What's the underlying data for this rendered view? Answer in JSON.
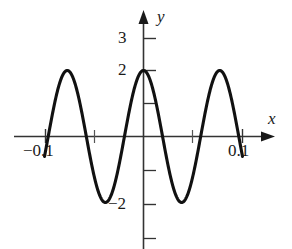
{
  "figure": {
    "type": "math-function-graph",
    "background_color": "#ffffff",
    "stroke_color": "#1a1a1a"
  },
  "axes": {
    "x_axis_label": "x",
    "y_axis_label": "y",
    "x_axis_name": "x-axis",
    "y_axis_name": "y-axis"
  },
  "tick_labels": {
    "y_3": "3",
    "y_2": "2",
    "y_neg2": "−2",
    "x_neg": "−0.1",
    "x_pos": "0.1"
  },
  "chart_data": {
    "type": "line",
    "title": "",
    "xlabel": "x",
    "ylabel": "y",
    "xlim": [
      -0.115,
      0.118
    ],
    "ylim": [
      -3.4,
      3.4
    ],
    "grid": false,
    "legend": null,
    "axis_style": "arrowed-cartesian",
    "x_ticks": [
      -0.1,
      -0.05,
      0.05,
      0.1
    ],
    "x_tick_labels": [
      "−0.1",
      "",
      "",
      "0.1"
    ],
    "y_ticks": [
      -3,
      -2,
      -1,
      1,
      2,
      3
    ],
    "y_tick_labels": [
      "",
      "−2",
      "",
      "",
      "2",
      "3"
    ],
    "series": [
      {
        "name": "y = 2 cos(81.6 x)",
        "amplitude": 2,
        "period": 0.077,
        "x_domain": [
          -0.1,
          0.1
        ],
        "x": [
          -0.1,
          -0.0904,
          -0.0808,
          -0.0712,
          -0.0616,
          -0.052,
          -0.0424,
          -0.0328,
          -0.0232,
          -0.0136,
          -0.004,
          0.004,
          0.0136,
          0.0232,
          0.0328,
          0.0424,
          0.052,
          0.0616,
          0.0712,
          0.0808,
          0.0904,
          0.1
        ],
        "y": [
          0,
          1.41,
          2,
          1.41,
          0,
          -1.41,
          -2,
          -1.41,
          0,
          1.41,
          2,
          2,
          1.41,
          0,
          -1.41,
          -2,
          -1.41,
          0,
          1.41,
          2,
          1.41,
          0
        ],
        "peaks": [
          {
            "x": -0.0808,
            "y": 2
          },
          {
            "x": 0,
            "y": 2
          },
          {
            "x": 0.0808,
            "y": 2
          }
        ],
        "valleys": [
          {
            "x": -0.0424,
            "y": -2
          },
          {
            "x": 0.0424,
            "y": -2
          }
        ],
        "zeros": [
          -0.1,
          -0.0616,
          -0.0232,
          0.0232,
          0.0616,
          0.1
        ]
      }
    ]
  }
}
